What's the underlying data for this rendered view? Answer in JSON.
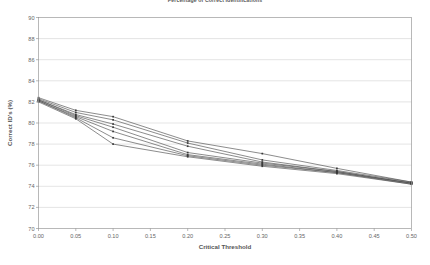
{
  "chart_data": {
    "type": "line",
    "title": "Percentage of Correct Identifications",
    "xlabel": "Critical Threshold",
    "ylabel": "Correct ID's (%)",
    "xlim": [
      0.0,
      0.5
    ],
    "ylim": [
      70,
      90
    ],
    "xticks": [
      "0.00",
      "0.05",
      "0.10",
      "0.15",
      "0.20",
      "0.25",
      "0.30",
      "0.35",
      "0.40",
      "0.45",
      "0.50"
    ],
    "xtick_values": [
      0.0,
      0.05,
      0.1,
      0.15,
      0.2,
      0.25,
      0.3,
      0.35,
      0.4,
      0.45,
      0.5
    ],
    "yticks": [
      "70",
      "72",
      "74",
      "76",
      "78",
      "80",
      "82",
      "84",
      "86",
      "88",
      "90"
    ],
    "ytick_values": [
      70,
      72,
      74,
      76,
      78,
      80,
      82,
      84,
      86,
      88,
      90
    ],
    "grid": true,
    "grid_axis": "y",
    "legend": false,
    "marker": "square",
    "line_color": "#4d4d4d",
    "marker_color": "#3a3a3a",
    "x": [
      0.0,
      0.05,
      0.1,
      0.2,
      0.3,
      0.4,
      0.5
    ],
    "series": [
      {
        "name": "Series 1",
        "values": [
          82.4,
          81.2,
          80.6,
          78.3,
          77.1,
          75.7,
          74.4
        ]
      },
      {
        "name": "Series 2",
        "values": [
          82.3,
          81.0,
          80.3,
          78.1,
          76.5,
          75.5,
          74.4
        ]
      },
      {
        "name": "Series 3",
        "values": [
          82.2,
          80.8,
          79.9,
          77.8,
          76.3,
          75.4,
          74.3
        ]
      },
      {
        "name": "Series 4",
        "values": [
          82.2,
          80.7,
          79.6,
          77.2,
          76.2,
          75.4,
          74.3
        ]
      },
      {
        "name": "Series 5",
        "values": [
          82.1,
          80.6,
          79.2,
          77.0,
          76.1,
          75.3,
          74.3
        ]
      },
      {
        "name": "Series 6",
        "values": [
          82.1,
          80.5,
          78.6,
          76.9,
          76.0,
          75.3,
          74.2
        ]
      },
      {
        "name": "Series 7",
        "values": [
          82.0,
          80.4,
          78.0,
          76.8,
          75.9,
          75.2,
          74.2
        ]
      }
    ]
  }
}
